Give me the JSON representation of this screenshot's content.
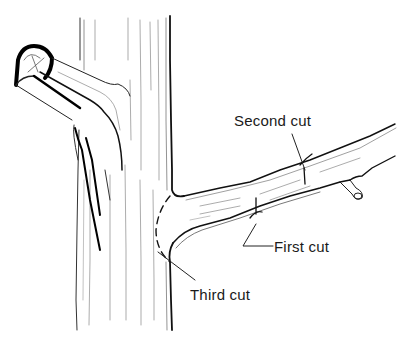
{
  "diagram": {
    "labels": {
      "second_cut": "Second cut",
      "first_cut": "First cut",
      "third_cut": "Third cut"
    },
    "colors": {
      "ink": "#1a1a1a",
      "grain": "#6b6b6b",
      "background": "#ffffff"
    }
  }
}
